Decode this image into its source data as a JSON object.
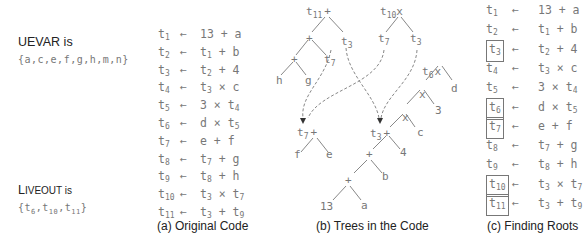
{
  "uevar": {
    "title": "UEVAR is",
    "set": "{a,c,e,f,g,h,m,n}"
  },
  "liveout": {
    "title_prefix": "L",
    "title_rest": "IVEOUT is",
    "set_open": "{t",
    "items": [
      "6",
      "10",
      "11"
    ],
    "set_close": "}"
  },
  "original_code": {
    "caption": "(a) Original Code",
    "lines": [
      {
        "lhs": "1",
        "rhs": "13 + a"
      },
      {
        "lhs": "2",
        "rhs_pre": "t",
        "rhs_sub": "1",
        "rhs_post": " + b"
      },
      {
        "lhs": "3",
        "rhs_pre": "t",
        "rhs_sub": "2",
        "rhs_post": " + 4"
      },
      {
        "lhs": "4",
        "rhs_pre": "t",
        "rhs_sub": "3",
        "rhs_post": " × c"
      },
      {
        "lhs": "5",
        "rhs": "3 × t",
        "rhs_sub": "4"
      },
      {
        "lhs": "6",
        "rhs": "d × t",
        "rhs_sub": "5"
      },
      {
        "lhs": "7",
        "rhs": "e + f"
      },
      {
        "lhs": "8",
        "rhs_pre": "t",
        "rhs_sub": "7",
        "rhs_post": " + g"
      },
      {
        "lhs": "9",
        "rhs_pre": "t",
        "rhs_sub": "8",
        "rhs_post": " + h"
      },
      {
        "lhs": "10",
        "rhs_pre": "t",
        "rhs_sub": "3",
        "rhs_post": " × t",
        "rhs_sub2": "7"
      },
      {
        "lhs": "11",
        "rhs_pre": "t",
        "rhs_sub": "3",
        "rhs_post": " + t",
        "rhs_sub2": "9"
      }
    ]
  },
  "trees": {
    "caption": "(b) Trees in the Code",
    "nodes": {
      "t11_root": {
        "name": "t",
        "sub": "11",
        "op": "+"
      },
      "t11_plus1": "+",
      "t11_t3": {
        "name": "t",
        "sub": "3"
      },
      "t11_plus2": "+",
      "t11_t7": {
        "name": "t",
        "sub": "7"
      },
      "t11_h": "h",
      "t11_g": "g",
      "t10_root": {
        "name": "t",
        "sub": "10",
        "op": "x"
      },
      "t10_t7": {
        "name": "t",
        "sub": "7"
      },
      "t10_t3": {
        "name": "t",
        "sub": "3"
      },
      "t6_root": {
        "name": "t",
        "sub": "6",
        "op": "x"
      },
      "t6_x1": "x",
      "t6_d": "d",
      "t6_x2": "x",
      "t6_3": "3",
      "t6_c": "c",
      "t3_root": {
        "name": "t",
        "sub": "3",
        "op": "+"
      },
      "t3_4": "4",
      "t3_plus": "+",
      "t3_b": "b",
      "t3_plus2": "+",
      "t3_a": "a",
      "t3_13": "13",
      "t7_root": {
        "name": "t",
        "sub": "7",
        "op": "+"
      },
      "t7_f": "f",
      "t7_e": "e"
    }
  },
  "finding_roots": {
    "caption": "(c) Finding Roots",
    "arrow": "←",
    "lines": [
      {
        "lhs": "1",
        "boxed": false,
        "rhs": "13 + a"
      },
      {
        "lhs": "2",
        "boxed": false,
        "rhs_pre": "t",
        "rhs_sub": "1",
        "rhs_post": " + b"
      },
      {
        "lhs": "3",
        "boxed": true,
        "rhs_pre": "t",
        "rhs_sub": "2",
        "rhs_post": " + 4"
      },
      {
        "lhs": "4",
        "boxed": false,
        "rhs_pre": "t",
        "rhs_sub": "3",
        "rhs_post": " × c"
      },
      {
        "lhs": "5",
        "boxed": false,
        "rhs": "3 × t",
        "rhs_sub": "4"
      },
      {
        "lhs": "6",
        "boxed": true,
        "rhs": "d × t",
        "rhs_sub": "5"
      },
      {
        "lhs": "7",
        "boxed": true,
        "rhs": "e + f"
      },
      {
        "lhs": "8",
        "boxed": false,
        "rhs_pre": "t",
        "rhs_sub": "7",
        "rhs_post": " + g"
      },
      {
        "lhs": "9",
        "boxed": false,
        "rhs_pre": "t",
        "rhs_sub": "8",
        "rhs_post": " + h"
      },
      {
        "lhs": "10",
        "boxed": true,
        "rhs_pre": "t",
        "rhs_sub": "3",
        "rhs_post": " × t",
        "rhs_sub2": "7"
      },
      {
        "lhs": "11",
        "boxed": true,
        "rhs_pre": "t",
        "rhs_sub": "3",
        "rhs_post": " + t",
        "rhs_sub2": "9"
      }
    ]
  },
  "arrow": "←"
}
